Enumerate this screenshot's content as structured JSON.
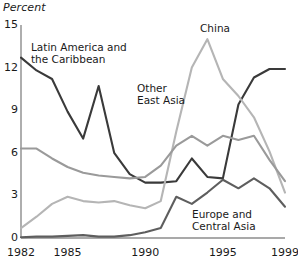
{
  "chart_data": {
    "type": "line",
    "title": "",
    "subtitle": "",
    "xlabel": "",
    "ylabel": "Percent",
    "ylabel_style": "italic",
    "xlim": [
      1982,
      1999
    ],
    "ylim": [
      0,
      15
    ],
    "yticks": [
      0,
      3,
      6,
      9,
      12,
      15
    ],
    "ytick_labels": [
      "0",
      "3",
      "6",
      "9",
      "12",
      "15"
    ],
    "xticks": [
      1982,
      1985,
      1990,
      1995,
      1999
    ],
    "xtick_labels": [
      "1982",
      "1985",
      "1990",
      "1995",
      "1999"
    ],
    "grid": false,
    "legend": "inline-annotations",
    "x": [
      1982,
      1983,
      1984,
      1985,
      1986,
      1987,
      1988,
      1989,
      1990,
      1991,
      1992,
      1993,
      1994,
      1995,
      1996,
      1997,
      1998,
      1999
    ],
    "series": [
      {
        "name": "Latin America and the Caribbean",
        "color": "#3a3a3a",
        "values": [
          12.7,
          11.8,
          11.2,
          8.9,
          7.0,
          10.7,
          6.0,
          4.5,
          3.9,
          3.9,
          4.0,
          5.6,
          4.3,
          4.2,
          9.4,
          11.3,
          11.9,
          11.9
        ]
      },
      {
        "name": "China",
        "color": "#b5b5b5",
        "values": [
          0.7,
          1.5,
          2.4,
          2.9,
          2.6,
          2.5,
          2.6,
          2.3,
          2.1,
          2.6,
          7.5,
          12.0,
          14.0,
          11.2,
          10.0,
          8.5,
          6.1,
          3.2
        ]
      },
      {
        "name": "Other East Asia",
        "color": "#9a9a9a",
        "values": [
          6.3,
          6.3,
          5.6,
          5.0,
          4.6,
          4.4,
          4.3,
          4.2,
          4.3,
          5.1,
          6.5,
          7.2,
          6.5,
          7.2,
          6.9,
          7.2,
          5.5,
          4.0
        ]
      },
      {
        "name": "Europe and Central Asia",
        "color": "#5e5e5e",
        "values": [
          0.05,
          0.1,
          0.1,
          0.15,
          0.2,
          0.1,
          0.1,
          0.2,
          0.4,
          0.7,
          2.9,
          2.4,
          3.2,
          4.1,
          3.5,
          4.2,
          3.5,
          2.2
        ]
      }
    ],
    "annotations": [
      {
        "name": "latin-america-label",
        "text": "Latin America and\nthe Caribbean",
        "x_px": 31,
        "y_px": 42
      },
      {
        "name": "china-label",
        "text": "China",
        "x_px": 200,
        "y_px": 23
      },
      {
        "name": "other-east-asia-label",
        "text": "Other\nEast Asia",
        "x_px": 137,
        "y_px": 83
      },
      {
        "name": "europe-label",
        "text": "Europe and\nCentral Asia",
        "x_px": 192,
        "y_px": 209
      }
    ]
  },
  "axis": {
    "ylabel": "Percent",
    "ytick_labels": [
      "15",
      "12",
      "9",
      "6",
      "3",
      "0"
    ],
    "xtick_labels": [
      "1982",
      "1985",
      "1990",
      "1995",
      "1999"
    ]
  }
}
